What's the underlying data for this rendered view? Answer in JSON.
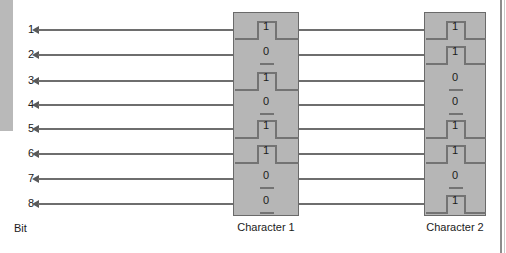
{
  "diagram": {
    "bit_axis_label": "Bit",
    "bit_labels": [
      "1",
      "2",
      "3",
      "4",
      "5",
      "6",
      "7",
      "8"
    ],
    "line_color": "#6e6e6e",
    "box_fill_color": "#b6b6b6",
    "box_border_color": "#6a6a6a",
    "text_color": "#1b1b1b",
    "characters": [
      {
        "caption": "Character 1",
        "bits": [
          "1",
          "0",
          "1",
          "0",
          "1",
          "1",
          "0",
          "0"
        ]
      },
      {
        "caption": "Character 2",
        "bits": [
          "1",
          "1",
          "0",
          "0",
          "1",
          "1",
          "0",
          "1"
        ]
      }
    ]
  }
}
